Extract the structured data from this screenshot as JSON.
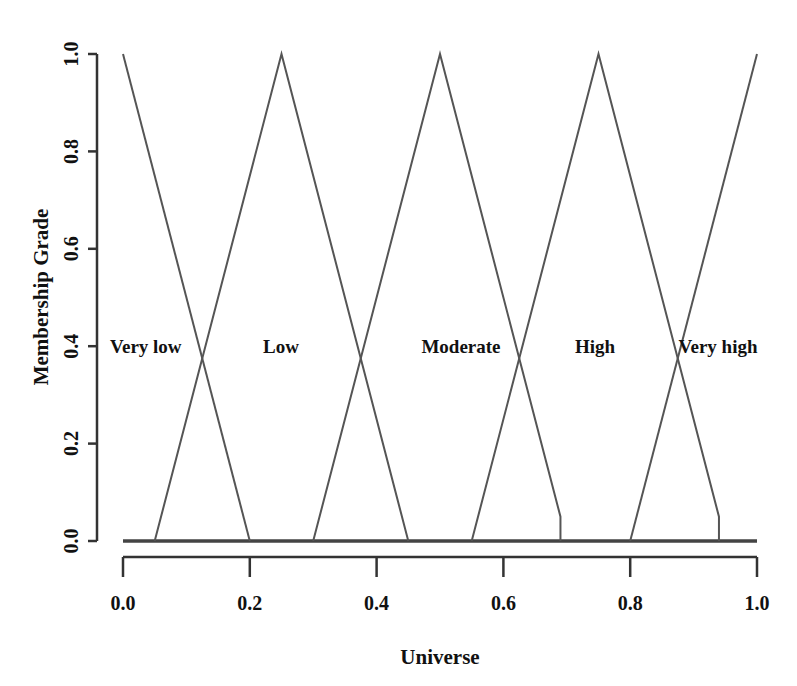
{
  "chart_data": {
    "type": "line",
    "title": "",
    "xlabel": "Universe",
    "ylabel": "Membership Grade",
    "xlim": [
      0.0,
      1.0
    ],
    "ylim": [
      0.0,
      1.0
    ],
    "x_ticks": [
      "0.0",
      "0.2",
      "0.4",
      "0.6",
      "0.8",
      "1.0"
    ],
    "y_ticks": [
      "0.0",
      "0.2",
      "0.4",
      "0.6",
      "0.8",
      "1.0"
    ],
    "grid": false,
    "legend": "none (inline labels)",
    "series": [
      {
        "name": "Very low",
        "x": [
          0.0,
          0.2
        ],
        "y": [
          1.0,
          0.0
        ]
      },
      {
        "name": "Low",
        "x": [
          0.05,
          0.25,
          0.45
        ],
        "y": [
          0.0,
          1.0,
          0.0
        ]
      },
      {
        "name": "Moderate",
        "x": [
          0.3,
          0.5,
          0.69,
          0.69
        ],
        "y": [
          0.0,
          1.0,
          0.05,
          0.0
        ]
      },
      {
        "name": "High",
        "x": [
          0.55,
          0.75,
          0.94,
          0.94
        ],
        "y": [
          0.0,
          1.0,
          0.05,
          0.0
        ]
      },
      {
        "name": "Very high",
        "x": [
          0.8,
          1.0
        ],
        "y": [
          0.0,
          1.0
        ]
      }
    ],
    "annotations": [
      {
        "text": "Very low",
        "x": 0.0,
        "y": 0.4
      },
      {
        "text": "Low",
        "x": 0.25,
        "y": 0.4
      },
      {
        "text": "Moderate",
        "x": 0.5,
        "y": 0.4
      },
      {
        "text": "High",
        "x": 0.75,
        "y": 0.4
      },
      {
        "text": "Very high",
        "x": 0.96,
        "y": 0.4
      }
    ],
    "line_color": "#555555",
    "axis_color": "#333333"
  }
}
